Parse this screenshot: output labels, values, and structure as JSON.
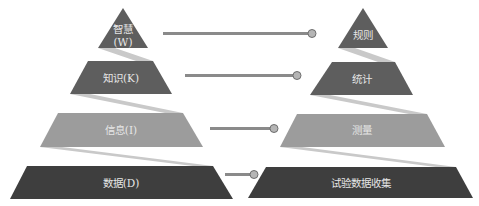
{
  "colors": {
    "level_top": "#5e5e5e",
    "level_second": "#5e5e5e",
    "level_third": "#9c9c9c",
    "level_bottom": "#3e3e3e",
    "ribbon": "#c9c9c9",
    "connector_line": "#8a8a8a",
    "connector_dot": "#b5b5b5",
    "label_text": "#e6e6e6"
  },
  "left_pyramid": {
    "levels": [
      {
        "label_line1": "智慧",
        "label_line2": "(W)"
      },
      {
        "label": "知识(K)"
      },
      {
        "label": "信息(I)"
      },
      {
        "label": "数据(D)"
      }
    ]
  },
  "right_pyramid": {
    "levels": [
      {
        "label": "规则"
      },
      {
        "label": "统计"
      },
      {
        "label": "测量"
      },
      {
        "label": "试验数据收集"
      }
    ]
  }
}
